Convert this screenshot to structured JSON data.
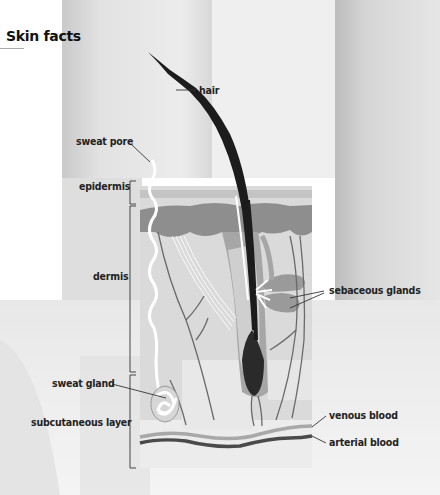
{
  "title": "Skin facts",
  "diagram": {
    "labels": {
      "hair": "hair",
      "sweat_pore": "sweat pore",
      "epidermis": "epidermis",
      "dermis": "dermis",
      "sebaceous_glands": "sebaceous glands",
      "sweat_gland": "sweat gland",
      "subcutaneous_layer": "subcutaneous layer",
      "venous_blood": "venous blood",
      "arterial_blood": "arterial blood"
    },
    "layers": [
      {
        "name": "epidermis",
        "bracket": "left"
      },
      {
        "name": "dermis",
        "bracket": "left"
      },
      {
        "name": "subcutaneous layer",
        "bracket": "left"
      }
    ],
    "colors": {
      "background_panel": "#dcdcdc",
      "epidermis": "#8f8f8f",
      "dermis": "#d2d2d2",
      "hair": "#1a1a1a",
      "follicle": "#9a9a9a",
      "vessels": "#6a6a6a",
      "venous": "#a8a8a8",
      "arterial": "#4a4a4a",
      "sweat_duct": "#ffffff",
      "text": "#222222"
    }
  }
}
